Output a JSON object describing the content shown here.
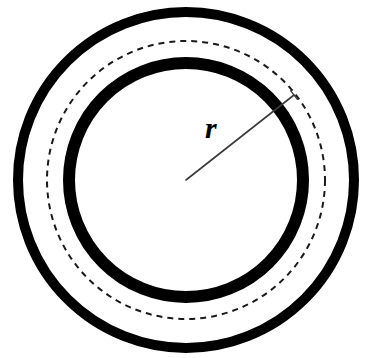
{
  "figure": {
    "kind": "geometry-diagram",
    "background_color": "#ffffff",
    "stroke_color": "#000000",
    "canvas": {
      "width": 371,
      "height": 358
    },
    "center": {
      "x": 186,
      "y": 180
    },
    "labels": {
      "radius_label": "r"
    },
    "shapes": [
      {
        "name": "outer-circle",
        "type": "circle",
        "radius": 168,
        "stroke_width": 10,
        "stroke_style": "solid",
        "color": "#000000"
      },
      {
        "name": "middle-dashed-circle",
        "type": "circle",
        "radius": 139,
        "stroke_width": 2,
        "stroke_style": "dashed",
        "dash_length": 6,
        "dash_gap": 5,
        "color": "#1a1a1a"
      },
      {
        "name": "inner-circle",
        "type": "circle",
        "radius": 117,
        "stroke_width": 12,
        "stroke_style": "solid",
        "color": "#000000"
      }
    ],
    "radius_line": {
      "name": "radius-line",
      "from": {
        "x": 186,
        "y": 180
      },
      "to": {
        "x": 294,
        "y": 95
      },
      "stroke_width": 1.6,
      "color": "#3a3a3a",
      "has_end_tick": true,
      "end_tick_length": 11,
      "label": "r",
      "label_position": {
        "x": 205,
        "y": 113
      }
    }
  },
  "chart_data": {
    "type": "diagram",
    "xlabel": "",
    "ylabel": "",
    "center": [
      186,
      180
    ],
    "series": [
      {
        "name": "outer-circle",
        "radius": 168,
        "style": "thick solid black"
      },
      {
        "name": "middle-dashed-circle",
        "radius": 139,
        "style": "thin dashed black"
      },
      {
        "name": "inner-circle",
        "radius": 117,
        "style": "thick solid black"
      }
    ],
    "annotations": [
      {
        "text": "r",
        "type": "radius-arrow",
        "from": [
          186,
          180
        ],
        "to": [
          294,
          95
        ],
        "label_at": [
          205,
          113
        ]
      }
    ]
  }
}
